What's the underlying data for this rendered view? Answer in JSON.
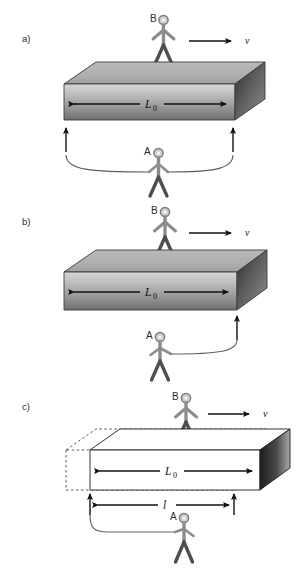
{
  "figure": {
    "background_color": "#ffffff",
    "ink_color": "#111111",
    "figure_color": "#8c8c8c",
    "figure_dark_color": "#4f4f4f",
    "head_fill": "#cfcfcf",
    "panels": [
      {
        "id": "a",
        "letter": "a)",
        "observer_top": "B",
        "observer_bottom": "A",
        "velocity_label": "v",
        "length_label": "L",
        "length_subscript": "0",
        "box_style": "solid-gray-gradient",
        "measure_arms": "both",
        "contracted_label": null,
        "contracted_subscript": null
      },
      {
        "id": "b",
        "letter": "b)",
        "observer_top": "B",
        "observer_bottom": "A",
        "velocity_label": "v",
        "length_label": "L",
        "length_subscript": "0",
        "box_style": "solid-gray-gradient",
        "measure_arms": "right-only",
        "contracted_label": null,
        "contracted_subscript": null
      },
      {
        "id": "c",
        "letter": "c)",
        "observer_top": "B",
        "observer_bottom": "A",
        "velocity_label": "v",
        "length_label": "L",
        "length_subscript": "0",
        "box_style": "outline-with-dashed-ghost",
        "measure_arms": "left-only",
        "contracted_label": "l",
        "contracted_subscript": ""
      }
    ]
  }
}
